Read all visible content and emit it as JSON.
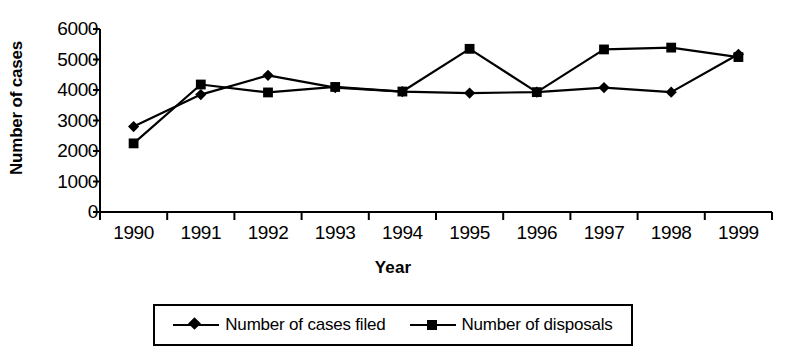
{
  "chart_data": {
    "type": "line",
    "title": "",
    "xlabel": "Year",
    "ylabel": "Number of cases",
    "categories": [
      "1990",
      "1991",
      "1992",
      "1993",
      "1994",
      "1995",
      "1996",
      "1997",
      "1998",
      "1999"
    ],
    "ylim": [
      0,
      6000
    ],
    "yticks": [
      "0",
      "1000",
      "2000",
      "3000",
      "4000",
      "5000",
      "6000"
    ],
    "ytick_values": [
      0,
      1000,
      2000,
      3000,
      4000,
      5000,
      6000
    ],
    "grid": false,
    "legend_position": "bottom",
    "series": [
      {
        "name": "Number of cases filed",
        "marker": "diamond",
        "color": "#000000",
        "values": [
          2800,
          3850,
          4480,
          4080,
          3950,
          3900,
          3930,
          4080,
          3930,
          5170
        ]
      },
      {
        "name": "Number of disposals",
        "marker": "square",
        "color": "#000000",
        "values": [
          2250,
          4180,
          3920,
          4100,
          3950,
          5350,
          3930,
          5330,
          5390,
          5080
        ]
      }
    ]
  },
  "legend": {
    "items": [
      {
        "label": "Number of cases filed",
        "marker": "diamond"
      },
      {
        "label": "Number of disposals",
        "marker": "square"
      }
    ]
  },
  "axes": {
    "y_title": "Number of cases",
    "x_title": "Year"
  }
}
